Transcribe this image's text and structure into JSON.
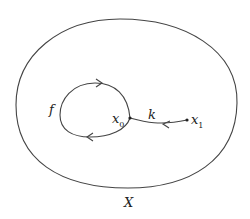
{
  "diagram": {
    "space_label": "X",
    "loop_label": "f",
    "path_label": "k",
    "base_point": {
      "name": "x",
      "sub": "0"
    },
    "end_point": {
      "name": "x",
      "sub": "1"
    },
    "colors": {
      "stroke": "#444444",
      "text": "#222222",
      "background": "#ffffff"
    }
  }
}
